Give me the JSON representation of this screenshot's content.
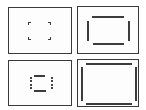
{
  "figure": {
    "layout": "2x2 grid of viewfinder frame diagrams",
    "colors": {
      "line": "#3a3a3a",
      "background": "#ffffff"
    },
    "panels": [
      {
        "id": "top-left",
        "description": "four small corner brackets marking a central focus area"
      },
      {
        "id": "top-right",
        "description": "inner rectangle outline formed by four separate line segments"
      },
      {
        "id": "bottom-left",
        "description": "small central frame with solid horizontal bars and dashed vertical sides"
      },
      {
        "id": "bottom-right",
        "description": "large inner frame of four line segments near the panel edges"
      }
    ]
  }
}
